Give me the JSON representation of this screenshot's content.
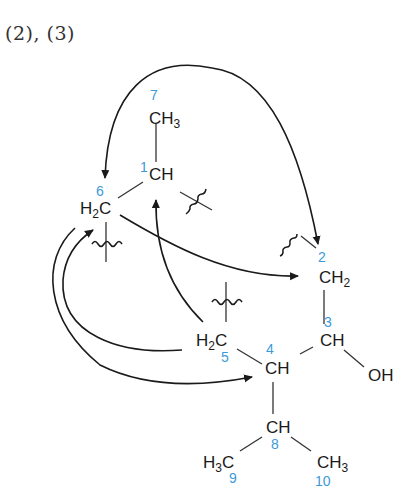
{
  "heading": "(2), (3)",
  "colors": {
    "atom_text": "#1a1a1a",
    "locant_number": "#3d9ad9",
    "background": "#ffffff"
  },
  "atoms": {
    "c1": {
      "label": "CH",
      "number": "1"
    },
    "c2": {
      "label": "CH",
      "sub": "2",
      "number": "2"
    },
    "c3": {
      "label": "CH",
      "number": "3"
    },
    "c4": {
      "label": "CH",
      "number": "4"
    },
    "c5": {
      "label_pre": "H",
      "sub": "2",
      "label_post": "C",
      "number": "5"
    },
    "c6": {
      "label_pre": "H",
      "sub": "2",
      "label_post": "C",
      "number": "6"
    },
    "c7": {
      "label": "CH",
      "sub": "3",
      "number": "7"
    },
    "c8": {
      "label": "CH",
      "number": "8"
    },
    "c9": {
      "label_pre": "H",
      "sub": "3",
      "label_post": "C",
      "number": "9"
    },
    "c10": {
      "label": "CH",
      "sub": "3",
      "number": "10"
    },
    "oh": {
      "label": "OH"
    }
  },
  "arrows": [
    {
      "from": "C2 bond",
      "to": "C6",
      "desc": "large arc over top"
    },
    {
      "from": "C6",
      "to": "C2",
      "desc": "crossing arrow"
    },
    {
      "from": "C5",
      "to": "C1"
    },
    {
      "from": "C5",
      "to": "C6",
      "desc": "inner left arc"
    },
    {
      "from": "C6",
      "to": "C4",
      "desc": "outer left arc"
    }
  ],
  "bond_cleavages": [
    "C1-C2",
    "C5-C6 (below C6)",
    "C5 (above)",
    "C2 (top left)"
  ]
}
